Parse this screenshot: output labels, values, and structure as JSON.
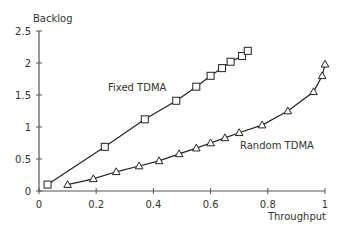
{
  "chart_data": {
    "type": "line",
    "title": "",
    "xlabel": "Throughput",
    "ylabel": "Backlog",
    "xlim": [
      0,
      1
    ],
    "ylim": [
      0,
      2.5
    ],
    "grid": false,
    "legend_position": "inline labels",
    "x_ticks": [
      "0",
      "0.2",
      "0.4",
      "0.6",
      "0.8",
      "1"
    ],
    "y_ticks": [
      "0",
      "0.5",
      "1",
      "1.5",
      "2",
      "2.5"
    ],
    "series": [
      {
        "name": "Fixed TDMA",
        "marker": "square",
        "x": [
          0.03,
          0.23,
          0.37,
          0.48,
          0.55,
          0.6,
          0.64,
          0.67,
          0.71,
          0.73
        ],
        "y": [
          0.1,
          0.69,
          1.12,
          1.41,
          1.63,
          1.8,
          1.92,
          2.02,
          2.11,
          2.19
        ]
      },
      {
        "name": "Random TDMA",
        "marker": "triangle",
        "x": [
          0.1,
          0.19,
          0.27,
          0.35,
          0.42,
          0.49,
          0.55,
          0.6,
          0.65,
          0.7,
          0.78,
          0.87,
          0.96,
          0.99,
          1.0
        ],
        "y": [
          0.1,
          0.19,
          0.3,
          0.39,
          0.47,
          0.58,
          0.67,
          0.75,
          0.83,
          0.91,
          1.03,
          1.25,
          1.55,
          1.8,
          1.98
        ]
      }
    ],
    "annotations": [
      {
        "text": "Fixed TDMA",
        "x": 0.29,
        "y": 1.6
      },
      {
        "text": "Random TDMA",
        "x": 0.7,
        "y": 0.7
      }
    ]
  }
}
